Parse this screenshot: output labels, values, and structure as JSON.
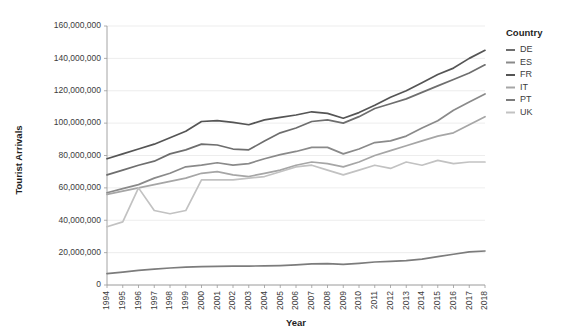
{
  "chart_data": {
    "type": "line",
    "title": "",
    "xlabel": "Year",
    "ylabel": "Tourist Arrivals",
    "xlim": [
      1994,
      2018
    ],
    "ylim": [
      0,
      160000000
    ],
    "ytick_step": 20000000,
    "grid": true,
    "legend_position": "right",
    "legend_title": "Country",
    "ytick_labels": [
      "0",
      "20,000,000",
      "40,000,000",
      "60,000,000",
      "80,000,000",
      "100,000,000",
      "120,000,000",
      "140,000,000",
      "160,000,000"
    ],
    "ytick_values": [
      0,
      20000000,
      40000000,
      60000000,
      80000000,
      100000000,
      120000000,
      140000000,
      160000000
    ],
    "categories": [
      1994,
      1995,
      1996,
      1997,
      1998,
      1999,
      2000,
      2001,
      2002,
      2003,
      2004,
      2005,
      2006,
      2007,
      2008,
      2009,
      2010,
      2011,
      2012,
      2013,
      2014,
      2015,
      2016,
      2017,
      2018
    ],
    "xtick_labels": [
      "1994",
      "1995",
      "1996",
      "1997",
      "1998",
      "1999",
      "2000",
      "2001",
      "2002",
      "2003",
      "2004",
      "2005",
      "2006",
      "2007",
      "2008",
      "2009",
      "2010",
      "2011",
      "2012",
      "2013",
      "2014",
      "2015",
      "2016",
      "2017",
      "2018"
    ],
    "series": [
      {
        "name": "DE",
        "color": "#6e6e6e",
        "values": [
          68000000,
          71000000,
          74000000,
          76500000,
          81000000,
          83500000,
          87000000,
          86500000,
          84000000,
          83500000,
          89000000,
          94000000,
          97000000,
          101000000,
          102000000,
          100000000,
          104000000,
          109000000,
          112000000,
          115000000,
          119000000,
          123000000,
          127000000,
          131000000,
          136000000
        ]
      },
      {
        "name": "ES",
        "color": "#8a8a8a",
        "values": [
          57000000,
          59500000,
          62000000,
          66000000,
          69000000,
          73000000,
          74000000,
          75500000,
          74000000,
          75000000,
          78000000,
          80500000,
          82500000,
          85000000,
          85000000,
          81000000,
          84000000,
          88000000,
          89000000,
          92000000,
          97000000,
          101500000,
          108000000,
          113000000,
          118000000
        ]
      },
      {
        "name": "FR",
        "color": "#555555",
        "values": [
          78000000,
          81000000,
          84000000,
          87000000,
          91000000,
          95000000,
          101000000,
          101500000,
          100500000,
          99000000,
          102000000,
          103500000,
          105000000,
          107000000,
          106000000,
          103000000,
          106500000,
          111000000,
          116000000,
          120000000,
          125000000,
          130000000,
          134000000,
          140000000,
          145000000
        ]
      },
      {
        "name": "IT",
        "color": "#a6a6a6",
        "values": [
          56000000,
          58000000,
          60000000,
          62000000,
          64000000,
          66000000,
          69000000,
          70000000,
          68000000,
          67000000,
          69000000,
          71000000,
          74000000,
          76000000,
          75000000,
          73000000,
          76000000,
          80000000,
          83000000,
          86000000,
          89000000,
          92000000,
          94000000,
          99000000,
          104000000
        ]
      },
      {
        "name": "PT",
        "color": "#7c7c7c",
        "values": [
          7000000,
          8000000,
          9000000,
          9800000,
          10500000,
          11000000,
          11300000,
          11500000,
          11600000,
          11700000,
          11800000,
          12000000,
          12400000,
          13000000,
          13200000,
          12800000,
          13400000,
          14200000,
          14600000,
          15000000,
          16000000,
          17500000,
          19000000,
          20500000,
          21000000
        ]
      },
      {
        "name": "UK",
        "color": "#c2c2c2",
        "values": [
          36000000,
          39000000,
          60000000,
          46000000,
          44000000,
          46000000,
          65000000,
          65000000,
          65000000,
          66000000,
          67000000,
          70000000,
          73000000,
          74000000,
          71000000,
          68000000,
          71000000,
          74000000,
          72000000,
          76000000,
          74000000,
          77000000,
          75000000,
          76000000,
          76000000
        ]
      }
    ]
  }
}
